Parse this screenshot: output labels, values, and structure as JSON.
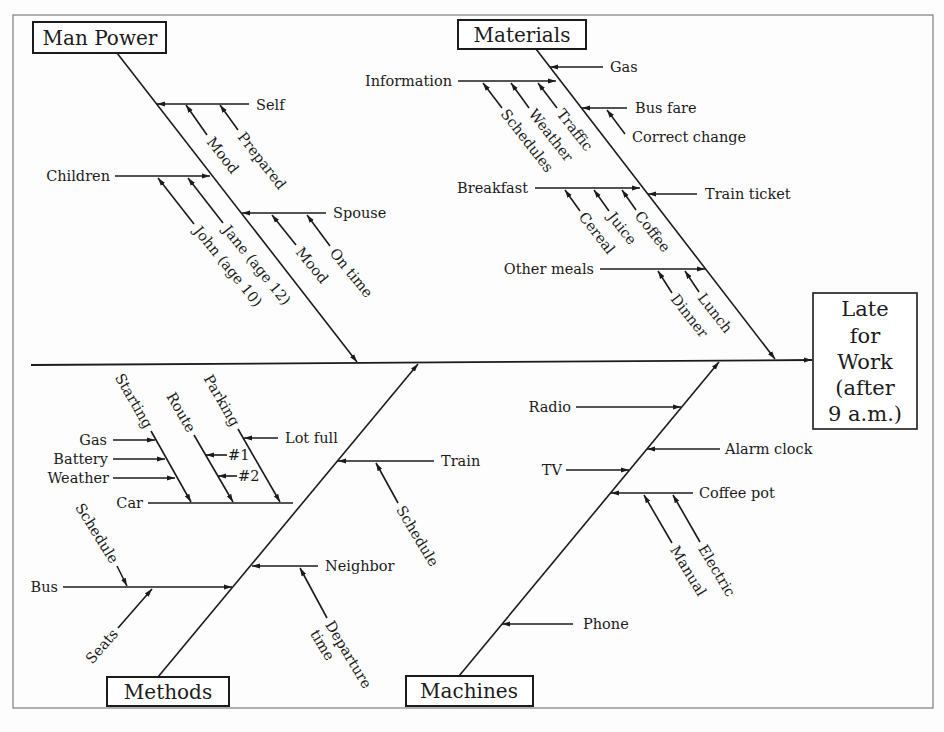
{
  "colors": {
    "ink": "#1b1b1b",
    "frame": "#7d7d7d",
    "background": "#fdfdfd"
  },
  "effect": {
    "lines": [
      "Late",
      "for",
      "Work",
      "(after",
      "9 a.m.)"
    ]
  },
  "categories": {
    "man_power": {
      "label": "Man Power",
      "causes": [
        {
          "label": "Self",
          "sub_causes": [
            {
              "label": "Mood"
            },
            {
              "label": "Prepared"
            }
          ]
        },
        {
          "label": "Children",
          "sub_causes": [
            {
              "label": "John (age 10)"
            },
            {
              "label": "Jane (age 12)"
            }
          ]
        },
        {
          "label": "Spouse",
          "sub_causes": [
            {
              "label": "Mood"
            },
            {
              "label": "On time"
            }
          ]
        }
      ]
    },
    "materials": {
      "label": "Materials",
      "causes": [
        {
          "label": "Gas",
          "sub_causes": []
        },
        {
          "label": "Information",
          "sub_causes": [
            {
              "label": "Schedules"
            },
            {
              "label": "Weather"
            },
            {
              "label": "Traffic"
            }
          ]
        },
        {
          "label": "Bus fare",
          "sub_causes": [
            {
              "label": "Correct change"
            }
          ]
        },
        {
          "label": "Breakfast",
          "sub_causes": [
            {
              "label": "Cereal"
            },
            {
              "label": "Juice"
            },
            {
              "label": "Coffee"
            }
          ]
        },
        {
          "label": "Train ticket",
          "sub_causes": []
        },
        {
          "label": "Other meals",
          "sub_causes": [
            {
              "label": "Dinner"
            },
            {
              "label": "Lunch"
            }
          ]
        }
      ]
    },
    "methods": {
      "label": "Methods",
      "causes": [
        {
          "label": "Car",
          "sub_causes": [
            {
              "label": "Starting",
              "sub_causes": [
                {
                  "label": "Gas"
                },
                {
                  "label": "Battery"
                },
                {
                  "label": "Weather"
                }
              ]
            },
            {
              "label": "Route",
              "sub_causes": [
                {
                  "label": "#1"
                },
                {
                  "label": "#2"
                }
              ]
            },
            {
              "label": "Parking",
              "sub_causes": [
                {
                  "label": "Lot full"
                }
              ]
            }
          ]
        },
        {
          "label": "Train",
          "sub_causes": [
            {
              "label": "Schedule"
            }
          ]
        },
        {
          "label": "Bus",
          "sub_causes": [
            {
              "label": "Schedule"
            },
            {
              "label": "Seats"
            }
          ]
        },
        {
          "label": "Neighbor",
          "sub_causes": [
            {
              "label": "Departure time",
              "lines": [
                "Departure",
                "time"
              ]
            }
          ]
        }
      ]
    },
    "machines": {
      "label": "Machines",
      "causes": [
        {
          "label": "Radio",
          "sub_causes": []
        },
        {
          "label": "Alarm clock",
          "sub_causes": []
        },
        {
          "label": "TV",
          "sub_causes": []
        },
        {
          "label": "Coffee pot",
          "sub_causes": [
            {
              "label": "Manual"
            },
            {
              "label": "Electric"
            }
          ]
        },
        {
          "label": "Phone",
          "sub_causes": []
        }
      ]
    }
  }
}
